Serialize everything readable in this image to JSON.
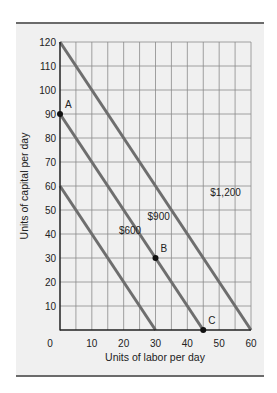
{
  "chart_data": {
    "type": "line",
    "title": "",
    "xlabel": "Units of labor per day",
    "ylabel": "Units of capital per day",
    "xlim": [
      0,
      60
    ],
    "ylim": [
      0,
      120
    ],
    "xticks": [
      0,
      10,
      20,
      30,
      40,
      50,
      60
    ],
    "yticks": [
      10,
      20,
      30,
      40,
      50,
      60,
      70,
      80,
      90,
      100,
      110,
      120
    ],
    "grid": true,
    "grid_step": {
      "x": 5,
      "y": 10
    },
    "series": [
      {
        "name": "$600",
        "x": [
          0,
          30
        ],
        "y": [
          60,
          0
        ]
      },
      {
        "name": "$900",
        "x": [
          0,
          45
        ],
        "y": [
          90,
          0
        ]
      },
      {
        "name": "$1,200",
        "x": [
          0,
          60
        ],
        "y": [
          120,
          0
        ]
      }
    ],
    "points": [
      {
        "label": "A",
        "x": 0,
        "y": 90
      },
      {
        "label": "B",
        "x": 30,
        "y": 30
      },
      {
        "label": "C",
        "x": 45,
        "y": 0
      }
    ],
    "line_labels": [
      {
        "text": "$600",
        "x": 22,
        "y": 40
      },
      {
        "text": "$900",
        "x": 31,
        "y": 46
      },
      {
        "text": "$1,200",
        "x": 52,
        "y": 56
      }
    ],
    "colors": {
      "line": "#6e6e6e",
      "grid": "#8a8a8a",
      "background": "#f0f0f0",
      "axis": "#222222"
    }
  }
}
